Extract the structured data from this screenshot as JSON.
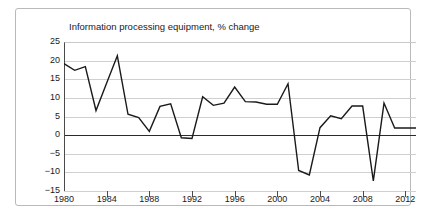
{
  "chart_data": {
    "type": "line",
    "title": "Information processing equipment, % change",
    "xlabel": "",
    "ylabel": "",
    "ylim": [
      -15,
      25
    ],
    "xlim": [
      1980,
      2013
    ],
    "ytick_values": [
      25,
      20,
      15,
      10,
      5,
      0,
      -5,
      -10,
      -15
    ],
    "ytick_labels": [
      "25",
      "20",
      "15",
      "10",
      "5",
      "0",
      "−5",
      "−10",
      "−15"
    ],
    "xtick_values": [
      1980,
      1984,
      1988,
      1992,
      1996,
      2000,
      2004,
      2008,
      2012
    ],
    "xtick_labels": [
      "1980",
      "1984",
      "1988",
      "1992",
      "1996",
      "2000",
      "2004",
      "2008",
      "2012"
    ],
    "grid": true,
    "grid_axis": "y",
    "legend": "none",
    "zero_line": true,
    "line_color": "#1a1a1a",
    "grid_color": "#d0d0d0",
    "axis_color": "#4a4a4a",
    "background_color": "#ffffff",
    "x": [
      1980,
      1981,
      1982,
      1983,
      1984,
      1985,
      1986,
      1987,
      1988,
      1989,
      1990,
      1991,
      1992,
      1993,
      1994,
      1995,
      1996,
      1997,
      1998,
      1999,
      2000,
      2001,
      2002,
      2003,
      2004,
      2005,
      2006,
      2007,
      2008,
      2009,
      2010,
      2011,
      2012,
      2013
    ],
    "values": [
      19.2,
      17.4,
      18.4,
      6.6,
      14.0,
      21.3,
      5.6,
      4.7,
      1.0,
      7.7,
      8.4,
      -0.7,
      -0.9,
      10.3,
      8.0,
      8.6,
      12.9,
      9.0,
      8.9,
      8.3,
      8.3,
      13.8,
      -9.5,
      -10.7,
      2.0,
      5.2,
      4.4,
      7.8,
      7.8,
      -12.3,
      8.6,
      1.9,
      1.9,
      1.9
    ],
    "series": [
      {
        "name": "Information processing equipment, % change",
        "values": [
          19.2,
          17.4,
          18.4,
          6.6,
          14.0,
          21.3,
          5.6,
          4.7,
          1.0,
          7.7,
          8.4,
          -0.7,
          -0.9,
          10.3,
          8.0,
          8.6,
          12.9,
          9.0,
          8.9,
          8.3,
          8.3,
          13.8,
          -9.5,
          -10.7,
          2.0,
          5.2,
          4.4,
          7.8,
          7.8,
          -12.3,
          8.6,
          1.9,
          1.9,
          1.9
        ]
      }
    ]
  }
}
